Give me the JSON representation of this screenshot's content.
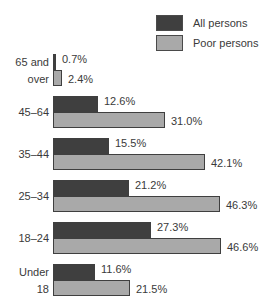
{
  "chart_data": {
    "type": "bar",
    "orientation": "horizontal",
    "title": "",
    "xlabel": "",
    "ylabel": "",
    "categories": [
      "65 and over",
      "45–64",
      "35–44",
      "25–34",
      "18–24",
      "Under 18"
    ],
    "series": [
      {
        "name": "All persons",
        "color": "#3f3f3f",
        "values": [
          0.7,
          12.6,
          15.5,
          21.2,
          27.3,
          11.6
        ]
      },
      {
        "name": "Poor persons",
        "color": "#a9a9a9",
        "values": [
          2.4,
          31.0,
          42.1,
          46.3,
          46.6,
          21.5
        ]
      }
    ],
    "value_labels": {
      "all": [
        "0.7%",
        "12.6%",
        "15.5%",
        "21.2%",
        "27.3%",
        "11.6%"
      ],
      "poor": [
        "2.4%",
        "31.0%",
        "42.1%",
        "46.3%",
        "46.6%",
        "21.5%"
      ]
    },
    "grid": false,
    "legend_position": "top-right"
  },
  "legend": {
    "all_label": "All persons",
    "poor_label": "Poor persons",
    "all_color": "#3f3f3f",
    "poor_color": "#a9a9a9"
  },
  "categories_display": [
    {
      "line1": "65 and",
      "line2": "over"
    },
    {
      "line1": "45–64"
    },
    {
      "line1": "35–44"
    },
    {
      "line1": "25–34"
    },
    {
      "line1": "18–24"
    },
    {
      "line1": "Under",
      "line2": "18"
    }
  ]
}
